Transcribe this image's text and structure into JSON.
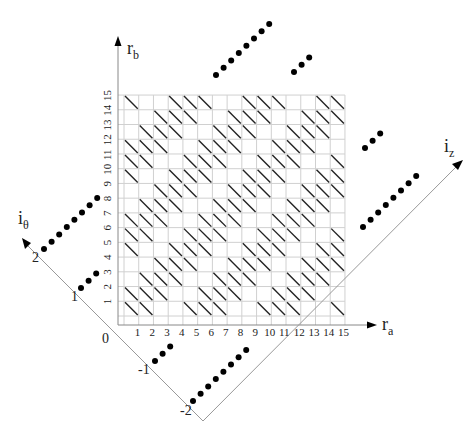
{
  "diagram": {
    "axes": {
      "ra": {
        "label": "r",
        "sub": "a"
      },
      "rb": {
        "label": "r",
        "sub": "b"
      },
      "i_theta": {
        "label": "i",
        "sub": "θ"
      },
      "i_z": {
        "label": "i",
        "sub": "z"
      }
    },
    "ra_ticks": [
      "1",
      "2",
      "3",
      "4",
      "5",
      "6",
      "7",
      "8",
      "9",
      "10",
      "11",
      "12",
      "13",
      "14",
      "15"
    ],
    "rb_ticks": [
      "1",
      "2",
      "3",
      "4",
      "5",
      "6",
      "7",
      "8",
      "9",
      "10",
      "11",
      "12",
      "13",
      "14",
      "15"
    ],
    "i_theta_ticks": [
      "0",
      "1",
      "2"
    ],
    "i_z_ticks": [
      "-1",
      "-2"
    ],
    "grid": {
      "cols": 15,
      "rows": 15
    },
    "hatch_rule": "cell (col i, row j from bottom) hatched when (i - j + 1) mod 5 in {0,1,2}",
    "colors": {
      "grid": "#d0d0d0",
      "hatch": "#222222",
      "axis": "#999999",
      "dot": "#000000",
      "arrow": "#000000"
    }
  }
}
